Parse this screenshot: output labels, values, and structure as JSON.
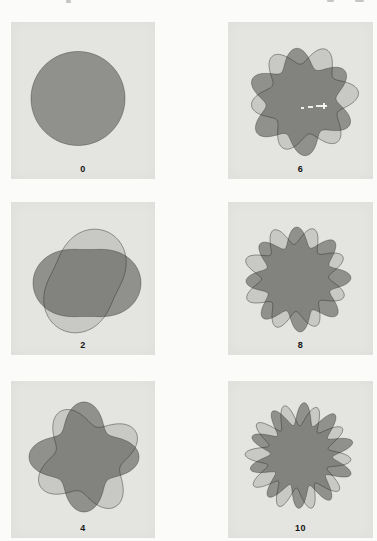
{
  "figure": {
    "colors": {
      "page_bg": "#fbfbf9",
      "panel_bg": "#e4e4e0",
      "dark_fill": "#90908d",
      "dark_stroke": "rgba(0,0,0,0.28)",
      "light_fill": "rgba(66,66,58,0.17)",
      "light_stroke": "rgba(45,45,40,0.5)",
      "label_color": "#161616"
    },
    "panels": [
      {
        "label": "0",
        "lobes": 0,
        "shapes": [
          {
            "role": "dark",
            "cx": 67,
            "cy": 76.5,
            "R": 47,
            "a": 0,
            "k": 0,
            "rot": 0
          }
        ]
      },
      {
        "label": "6",
        "lobes": 6,
        "shapes": [
          {
            "role": "dark",
            "cx": 73,
            "cy": 80,
            "R": 44.5,
            "a": 0.21,
            "k": 6,
            "rot": 35
          },
          {
            "role": "light",
            "cx": 77,
            "cy": 77,
            "R": 44.5,
            "a": 0.21,
            "k": 6,
            "rot": 7
          }
        ]
      },
      {
        "label": "2",
        "lobes": 2,
        "shapes": [
          {
            "role": "dark",
            "cx": 76,
            "cy": 81,
            "R": 43.7,
            "a": 0.235,
            "k": 2,
            "rot": 0
          },
          {
            "role": "light",
            "cx": 74,
            "cy": 79,
            "R": 43.7,
            "a": 0.235,
            "k": 2,
            "rot": 65
          }
        ]
      },
      {
        "label": "8",
        "lobes": 8,
        "shapes": [
          {
            "role": "dark",
            "cx": 70.5,
            "cy": 77.5,
            "R": 43,
            "a": 0.22,
            "k": 8,
            "rot": 2
          },
          {
            "role": "light",
            "cx": 67,
            "cy": 76,
            "R": 43,
            "a": 0.22,
            "k": 8,
            "rot": 24
          }
        ]
      },
      {
        "label": "4",
        "lobes": 4,
        "shapes": [
          {
            "role": "dark",
            "cx": 73,
            "cy": 76,
            "R": 44,
            "a": 0.25,
            "k": 4,
            "rot": 0
          },
          {
            "role": "light",
            "cx": 77,
            "cy": 78,
            "R": 44,
            "a": 0.25,
            "k": 4,
            "rot": 30
          }
        ]
      },
      {
        "label": "10",
        "lobes": 10,
        "shapes": [
          {
            "role": "dark",
            "cx": 73.5,
            "cy": 74.5,
            "R": 42,
            "a": 0.26,
            "k": 10,
            "rot": 15
          },
          {
            "role": "light",
            "cx": 70,
            "cy": 76,
            "R": 42,
            "a": 0.26,
            "k": 10,
            "rot": 33
          }
        ]
      }
    ]
  }
}
